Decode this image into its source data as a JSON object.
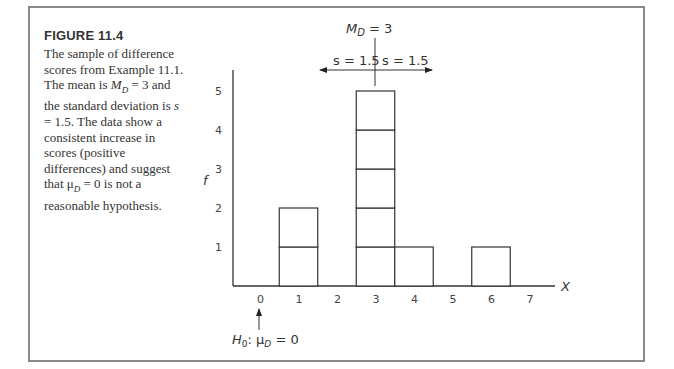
{
  "figure": {
    "title": "FIGURE 11.4",
    "caption": "The sample of difference scores from Example 11.1. The mean is M_D = 3 and the standard deviation is s = 1.5. The data show a consistent increase in scores (positive differences) and suggest that μ_D = 0 is not a reasonable hypothesis."
  },
  "annotations": {
    "mean_label": "M",
    "mean_sub": "D",
    "mean_value": " = 3",
    "sd_left": "s = 1.5",
    "sd_right": "s = 1.5",
    "h0_label": "H",
    "h0_sub": "0",
    "h0_mid": ": μ",
    "h0_mu_sub": "D",
    "h0_value": " = 0",
    "x_axis_label": "X",
    "y_axis_label": "f"
  },
  "chart_data": {
    "type": "bar",
    "title": "FIGURE 11.4",
    "xlabel": "X",
    "ylabel": "f",
    "categories": [
      0,
      1,
      2,
      3,
      4,
      5,
      6,
      7
    ],
    "values": [
      0,
      2,
      0,
      5,
      1,
      0,
      1,
      0
    ],
    "x_ticks": [
      "0",
      "1",
      "2",
      "3",
      "4",
      "5",
      "6",
      "7"
    ],
    "y_ticks": [
      "1",
      "2",
      "3",
      "4",
      "5"
    ],
    "ylim": [
      0,
      5
    ],
    "grid": false,
    "annotations": [
      {
        "text": "M_D = 3",
        "x": 3
      },
      {
        "text": "s = 1.5",
        "direction": "left",
        "from": 3
      },
      {
        "text": "s = 1.5",
        "direction": "right",
        "from": 3
      },
      {
        "text": "H0: μD = 0",
        "x": 0,
        "arrow": "up"
      }
    ]
  }
}
